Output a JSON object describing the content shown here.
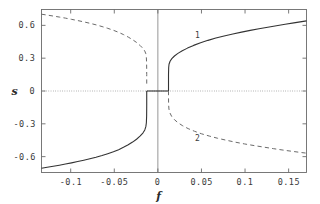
{
  "chart_data": {
    "type": "line",
    "title": "",
    "xlabel": "f",
    "ylabel": "s",
    "xlim": [
      -0.1335,
      0.1705
    ],
    "ylim": [
      -0.745,
      0.745
    ],
    "grid": false,
    "legend_position": "inline-annotations",
    "xticks": [
      -0.1,
      -0.05,
      0,
      0.05,
      0.1,
      0.15
    ],
    "xtick_labels": [
      "-0.1",
      "-0.05",
      "0",
      "0.05",
      "0.1",
      "0.15"
    ],
    "yticks": [
      0.6,
      0.3,
      0,
      -0.3,
      -0.6
    ],
    "ytick_labels": [
      "0.6",
      "0.3",
      "0",
      "-0.3",
      "-0.6"
    ],
    "annotations": [
      {
        "text": "1",
        "x": 0.0455,
        "y": 0.505,
        "curve": "upper-right-solid"
      },
      {
        "text": "2",
        "x": 0.0455,
        "y": -0.435,
        "curve": "lower-right-dashed"
      }
    ],
    "reference_lines": [
      {
        "name": "zero-horizontal",
        "orientation": "horizontal",
        "value": 0,
        "style": "dotted"
      },
      {
        "name": "zero-vertical",
        "orientation": "vertical",
        "value": 0,
        "style": "solid"
      }
    ],
    "fold_points": [
      {
        "name": "left-fold",
        "x": -0.0128,
        "y": 0.0
      },
      {
        "name": "right-fold",
        "x": 0.0122,
        "y": 0.0
      }
    ],
    "series": [
      {
        "name": "upper-left-unstable",
        "style": "dashed",
        "label": "",
        "points": [
          [
            -0.1335,
            0.702
          ],
          [
            -0.127,
            0.694
          ],
          [
            -0.12,
            0.685
          ],
          [
            -0.113,
            0.676
          ],
          [
            -0.106,
            0.666
          ],
          [
            -0.099,
            0.655
          ],
          [
            -0.092,
            0.644
          ],
          [
            -0.085,
            0.632
          ],
          [
            -0.078,
            0.619
          ],
          [
            -0.071,
            0.605
          ],
          [
            -0.064,
            0.589
          ],
          [
            -0.0575,
            0.573
          ],
          [
            -0.051,
            0.555
          ],
          [
            -0.045,
            0.536
          ],
          [
            -0.0395,
            0.516
          ],
          [
            -0.034,
            0.493
          ],
          [
            -0.029,
            0.469
          ],
          [
            -0.0245,
            0.444
          ],
          [
            -0.0205,
            0.417
          ],
          [
            -0.0172,
            0.39
          ],
          [
            -0.015,
            0.365
          ],
          [
            -0.0138,
            0.34
          ],
          [
            -0.0132,
            0.305
          ],
          [
            -0.0129,
            0.25
          ],
          [
            -0.0128,
            0.15
          ],
          [
            -0.0128,
            0.06
          ]
        ]
      },
      {
        "name": "lower-left-stable",
        "style": "solid",
        "label": "",
        "points": [
          [
            -0.1335,
            -0.706
          ],
          [
            -0.127,
            -0.697
          ],
          [
            -0.12,
            -0.688
          ],
          [
            -0.113,
            -0.678
          ],
          [
            -0.106,
            -0.668
          ],
          [
            -0.099,
            -0.657
          ],
          [
            -0.092,
            -0.645
          ],
          [
            -0.085,
            -0.633
          ],
          [
            -0.078,
            -0.62
          ],
          [
            -0.071,
            -0.606
          ],
          [
            -0.064,
            -0.59
          ],
          [
            -0.0575,
            -0.573
          ],
          [
            -0.051,
            -0.555
          ],
          [
            -0.045,
            -0.536
          ],
          [
            -0.0395,
            -0.515
          ],
          [
            -0.034,
            -0.492
          ],
          [
            -0.029,
            -0.467
          ],
          [
            -0.0245,
            -0.441
          ],
          [
            -0.0205,
            -0.413
          ],
          [
            -0.0172,
            -0.384
          ],
          [
            -0.015,
            -0.356
          ],
          [
            -0.0138,
            -0.326
          ],
          [
            -0.0132,
            -0.29
          ],
          [
            -0.0129,
            -0.23
          ],
          [
            -0.0128,
            -0.13
          ],
          [
            -0.0128,
            -0.03
          ],
          [
            -0.0128,
            0.0
          ]
        ]
      },
      {
        "name": "zero-branch-stable",
        "style": "solid",
        "label": "",
        "points": [
          [
            -0.0128,
            0.0
          ],
          [
            0.0,
            0.0
          ],
          [
            0.0122,
            0.0
          ]
        ]
      },
      {
        "name": "upper-right-stable",
        "style": "solid",
        "label": "1",
        "points": [
          [
            0.0122,
            0.0
          ],
          [
            0.0122,
            0.06
          ],
          [
            0.0122,
            0.15
          ],
          [
            0.0124,
            0.215
          ],
          [
            0.0128,
            0.245
          ],
          [
            0.014,
            0.272
          ],
          [
            0.016,
            0.296
          ],
          [
            0.019,
            0.32
          ],
          [
            0.023,
            0.344
          ],
          [
            0.028,
            0.368
          ],
          [
            0.034,
            0.392
          ],
          [
            0.041,
            0.417
          ],
          [
            0.049,
            0.441
          ],
          [
            0.0575,
            0.463
          ],
          [
            0.0665,
            0.484
          ],
          [
            0.076,
            0.503
          ],
          [
            0.086,
            0.521
          ],
          [
            0.096,
            0.538
          ],
          [
            0.106,
            0.554
          ],
          [
            0.116,
            0.569
          ],
          [
            0.126,
            0.583
          ],
          [
            0.136,
            0.597
          ],
          [
            0.146,
            0.61
          ],
          [
            0.156,
            0.623
          ],
          [
            0.165,
            0.634
          ],
          [
            0.1705,
            0.641
          ]
        ]
      },
      {
        "name": "lower-right-unstable",
        "style": "dashed",
        "label": "2",
        "points": [
          [
            0.0122,
            0.0
          ],
          [
            0.0122,
            -0.06
          ],
          [
            0.0123,
            -0.12
          ],
          [
            0.0127,
            -0.165
          ],
          [
            0.0138,
            -0.2
          ],
          [
            0.0158,
            -0.232
          ],
          [
            0.019,
            -0.262
          ],
          [
            0.0232,
            -0.291
          ],
          [
            0.0285,
            -0.318
          ],
          [
            0.0348,
            -0.344
          ],
          [
            0.042,
            -0.368
          ],
          [
            0.05,
            -0.391
          ],
          [
            0.059,
            -0.412
          ],
          [
            0.0685,
            -0.432
          ],
          [
            0.0785,
            -0.45
          ],
          [
            0.089,
            -0.468
          ],
          [
            0.0995,
            -0.484
          ],
          [
            0.1105,
            -0.499
          ],
          [
            0.1215,
            -0.513
          ],
          [
            0.1325,
            -0.527
          ],
          [
            0.1435,
            -0.54
          ],
          [
            0.1545,
            -0.552
          ],
          [
            0.165,
            -0.563
          ],
          [
            0.1705,
            -0.568
          ]
        ]
      }
    ],
    "colors": {
      "frame": "#6b6b6b",
      "stable_curve": "#333333",
      "unstable_curve": "#6a6a6a",
      "zero_line": "#8a8a8a",
      "text": "#3a3a3a",
      "background": "#ffffff"
    }
  }
}
